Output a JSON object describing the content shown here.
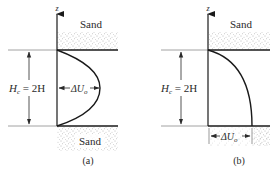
{
  "figure": {
    "panels": [
      {
        "id": "a",
        "caption": "(a)",
        "axis_label": "z",
        "top_material": "Sand",
        "bottom_material": "Sand",
        "height_label_main": "H",
        "height_label_sub": "c",
        "height_label_rest": " = 2H",
        "displacement_label_delta": "ΔU",
        "displacement_label_sub": "o",
        "profile": "parabolic (symmetric, max at mid-depth)"
      },
      {
        "id": "b",
        "caption": "(b)",
        "axis_label": "z",
        "top_material": "Sand",
        "bottom_material": "",
        "height_label_main": "H",
        "height_label_sub": "c",
        "height_label_rest": " = 2H",
        "displacement_label_delta": "ΔU",
        "displacement_label_sub": "o",
        "profile": "half-parabolic (max at base)"
      }
    ],
    "colors": {
      "line": "#1a1a1a",
      "text": "#2a2a2a",
      "sand_dots": "#6a6a6a",
      "guide": "#8a8a8a"
    }
  }
}
